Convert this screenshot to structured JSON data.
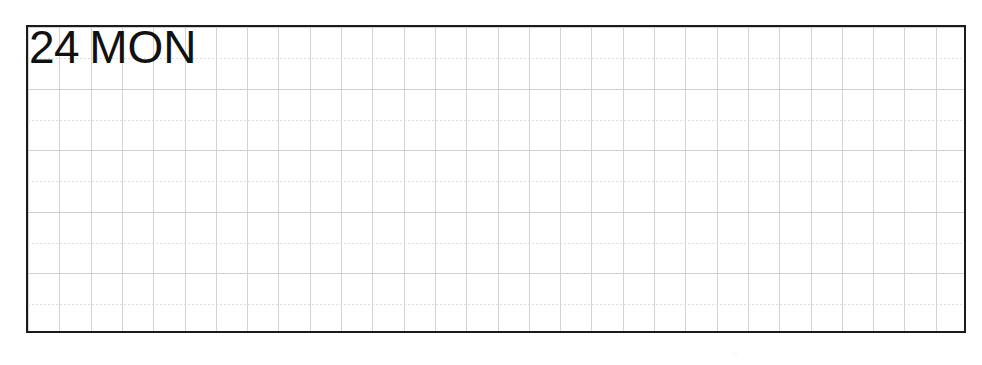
{
  "page": {
    "background_color": "#ffffff",
    "width": 982,
    "height": 365
  },
  "note_panel": {
    "name": "daily-planner-grid-block",
    "border_color": "#1b1b1b",
    "border_width_px": 2.5,
    "fill_color": "#ffffff",
    "grid": {
      "columns": 30,
      "rows": 10,
      "cell_width_px": 31.3,
      "cell_height_px": 30.8,
      "vertical_line_color": "#d2d2d2",
      "horizontal_major_line_color": "#cfcfcf",
      "horizontal_minor_line_color": "#dedede",
      "horizontal_minor_style": "dotted"
    },
    "content": ""
  },
  "day_entry": {
    "date_number": "24",
    "weekday_abbreviation": "MON",
    "full_label": "24 MON",
    "text_color": "#111111"
  },
  "artifacts": {
    "scan_speck_color": "#fbfbfb"
  }
}
